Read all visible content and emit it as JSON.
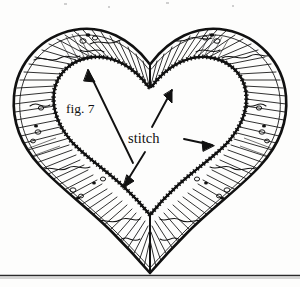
{
  "figure": {
    "caption_label": "fig. 7",
    "stitch_label": "stitch",
    "style": "hand-drawn black ink line illustration, hatched rim, sawtooth stitch edge",
    "colors": {
      "ink": "#111111",
      "background": "#fdfdfc",
      "hatch": "#1a1a1a",
      "rule": "#2b2b2b"
    },
    "elements": {
      "outer_outline_name": "heart outer edge",
      "inner_outline_name": "heart inner stitched edge",
      "hatching_name": "radial hatching rim",
      "seam_name": "center vertical seam",
      "baseline_name": "bottom horizontal rule"
    },
    "arrows": [
      {
        "name": "arrow-to-upper-left-stitch",
        "from_label": "fig. 7",
        "points_to": "upper left inner stitch edge"
      },
      {
        "name": "arrow-to-cleft-stitch",
        "from_label": "stitch",
        "points_to": "inner cleft stitch edge"
      },
      {
        "name": "arrow-to-right-stitch",
        "from_label": "stitch",
        "points_to": "right inner stitch edge"
      },
      {
        "name": "arrow-to-lower-left-stitch",
        "from_label": "stitch",
        "points_to": "lower left inner stitch edge"
      }
    ]
  }
}
